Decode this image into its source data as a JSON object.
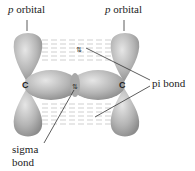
{
  "labels": {
    "p_orbital_left_italic": "p",
    "p_orbital_left_rest": " orbital",
    "p_orbital_right_italic": "p",
    "p_orbital_right_rest": " orbital",
    "pi_bond": "pi bond",
    "sigma_line1": "sigma",
    "sigma_line2": "bond",
    "carbon_left": "C",
    "carbon_right": "C"
  },
  "colors": {
    "lobe": "#b8b8b8",
    "lobe_dark": "#8a8a8a",
    "overlap_dash": "#c8c8c8",
    "text": "#222222"
  }
}
